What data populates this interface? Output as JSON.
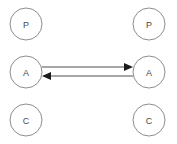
{
  "diagram": {
    "type": "node-graph",
    "width": 177,
    "height": 144,
    "background_color": "#ffffff",
    "node_stroke_color": "#8d8d8d",
    "node_fill_color": "#ffffff",
    "label_color": "#4a4a4a",
    "edge_color": "#4f4f4f",
    "arrowhead_color": "#1b1b1b",
    "nodes": [
      {
        "id": "p-left",
        "label": "P",
        "cx": 26,
        "cy": 24,
        "r": 16
      },
      {
        "id": "p-right",
        "label": "P",
        "cx": 149,
        "cy": 24,
        "r": 16
      },
      {
        "id": "a-left",
        "label": "A",
        "cx": 26,
        "cy": 72,
        "r": 16
      },
      {
        "id": "a-right",
        "label": "A",
        "cx": 149,
        "cy": 72,
        "r": 16
      },
      {
        "id": "c-left",
        "label": "C",
        "cx": 26,
        "cy": 120,
        "r": 16
      },
      {
        "id": "c-right",
        "label": "C",
        "cx": 149,
        "cy": 120,
        "r": 16
      }
    ],
    "edges": [
      {
        "id": "edge-a-left-to-a-right",
        "from": "a-left",
        "to": "a-right",
        "direction": "right",
        "x1": 42,
        "y1": 67,
        "x2": 133,
        "y2": 67
      },
      {
        "id": "edge-a-right-to-a-left",
        "from": "a-right",
        "to": "a-left",
        "direction": "left",
        "x1": 133,
        "y1": 76,
        "x2": 42,
        "y2": 76
      }
    ]
  }
}
